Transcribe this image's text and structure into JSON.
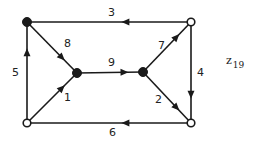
{
  "graph_label": {
    "main": "z",
    "subscript": "19"
  },
  "nodes": [
    {
      "id": "a",
      "x": 27,
      "y": 22,
      "filled": true
    },
    {
      "id": "b",
      "x": 191,
      "y": 22,
      "filled": false
    },
    {
      "id": "c",
      "x": 77,
      "y": 73,
      "filled": true
    },
    {
      "id": "d",
      "x": 143,
      "y": 72,
      "filled": true
    },
    {
      "id": "e",
      "x": 27,
      "y": 123,
      "filled": false
    },
    {
      "id": "f",
      "x": 191,
      "y": 123,
      "filled": false
    }
  ],
  "edges": [
    {
      "from": "b",
      "to": "a",
      "label": "3"
    },
    {
      "from": "b",
      "to": "f",
      "label": "4"
    },
    {
      "from": "e",
      "to": "a",
      "label": "5"
    },
    {
      "from": "f",
      "to": "e",
      "label": "6"
    },
    {
      "from": "a",
      "to": "c",
      "label": "8"
    },
    {
      "from": "e",
      "to": "c",
      "label": "1"
    },
    {
      "from": "c",
      "to": "d",
      "label": "9"
    },
    {
      "from": "d",
      "to": "b",
      "label": "7"
    },
    {
      "from": "d",
      "to": "f",
      "label": "2"
    }
  ],
  "colors": {
    "stroke": "#1a1a1a",
    "background": "#ffffff"
  }
}
